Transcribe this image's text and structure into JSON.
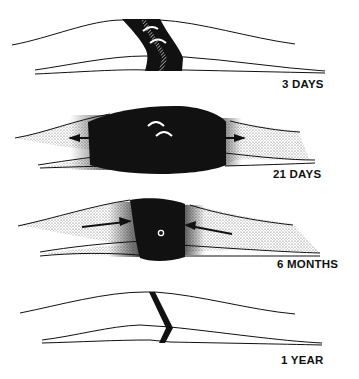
{
  "figure": {
    "colors": {
      "ink": "#111111",
      "background": "#ffffff",
      "stipple": "#9a9a9a"
    },
    "panels": [
      {
        "id": "3-days",
        "label": "3 DAYS",
        "features": [
          "fracture gap filled with hematoma (black band)",
          "hatched fracture line",
          "two white curved marks"
        ]
      },
      {
        "id": "21-days",
        "label": "21 DAYS",
        "features": [
          "large black callus mass",
          "stippled periosteal reaction",
          "two white curved marks",
          "outward arrows on each side"
        ]
      },
      {
        "id": "6-months",
        "label": "6 MONTHS",
        "features": [
          "remodeling callus",
          "stippled bone",
          "inward arrows on each side",
          "small white ring in center"
        ]
      },
      {
        "id": "1-year",
        "label": "1 YEAR",
        "features": [
          "healed bone",
          "thin black chevron-shaped scar line"
        ]
      }
    ]
  }
}
